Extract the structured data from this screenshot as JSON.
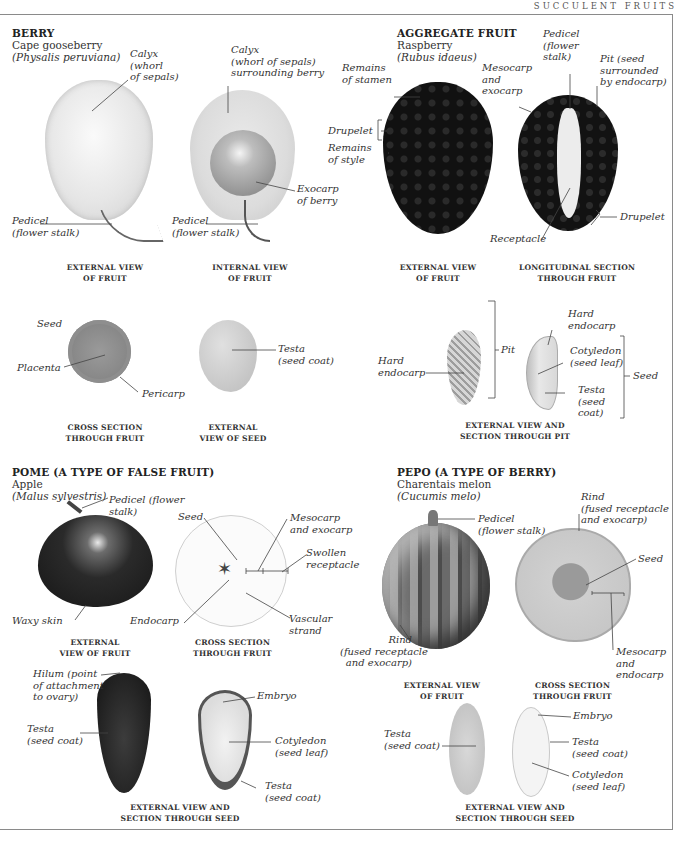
{
  "running_head": "SUCCULENT FRUITS",
  "colors": {
    "frame": "#8a8a8a",
    "text": "#2a2a2a",
    "apple": "#1e1e1e",
    "raspberry": "#141414",
    "melon_rind": "#5a5a5a",
    "melon_flesh": "#c9c9c9"
  },
  "sections": {
    "berry": {
      "title": "BERRY",
      "common_name": "Cape gooseberry",
      "scientific_name": "(Physalis peruviana)",
      "labels": {
        "calyx_ext": "Calyx\n(whorl\nof sepals)",
        "calyx_int": "Calyx\n(whorl of sepals)\nsurrounding berry",
        "pedicel_ext": "Pedicel\n(flower stalk)",
        "pedicel_int": "Pedicel\n(flower stalk)",
        "exocarp": "Exocarp\nof berry",
        "seed": "Seed",
        "placenta": "Placenta",
        "pericarp": "Pericarp",
        "testa": "Testa\n(seed coat)"
      },
      "captions": {
        "external_fruit": "EXTERNAL VIEW\nOF FRUIT",
        "internal_fruit": "INTERNAL VIEW\nOF FRUIT",
        "cross_section": "CROSS SECTION\nTHROUGH FRUIT",
        "external_seed": "EXTERNAL\nVIEW OF SEED"
      }
    },
    "aggregate": {
      "title": "AGGREGATE FRUIT",
      "common_name": "Raspberry",
      "scientific_name": "(Rubus idaeus)",
      "labels": {
        "stamen": "Remains\nof stamen",
        "drupelet_ext": "Drupelet",
        "style": "Remains\nof style",
        "mesocarp": "Mesocarp\nand\nexocarp",
        "pedicel": "Pedicel\n(flower\nstalk)",
        "pit": "Pit (seed\nsurrounded\nby endocarp)",
        "receptacle": "Receptacle",
        "drupelet_sec": "Drupelet",
        "hard_endocarp_ext": "Hard\nendocarp",
        "pit_bracket": "Pit",
        "hard_endocarp_sec": "Hard\nendocarp",
        "cotyledon": "Cotyledon\n(seed leaf)",
        "testa": "Testa\n(seed\ncoat)",
        "seed_bracket": "Seed"
      },
      "captions": {
        "external_fruit": "EXTERNAL VIEW\nOF FRUIT",
        "longitudinal": "LONGITUDINAL SECTION\nTHROUGH FRUIT",
        "pit": "EXTERNAL VIEW AND\nSECTION THROUGH PIT"
      }
    },
    "pome": {
      "title": "POME (A TYPE OF FALSE FRUIT)",
      "common_name": "Apple",
      "scientific_name": "(Malus sylvestris)",
      "labels": {
        "pedicel": "Pedicel (flower\nstalk)",
        "waxy_skin": "Waxy skin",
        "seed": "Seed",
        "mesocarp": "Mesocarp\nand exocarp",
        "receptacle": "Swollen\nreceptacle",
        "endocarp": "Endocarp",
        "vascular": "Vascular\nstrand",
        "hilum": "Hilum (point\nof attachment\nto ovary)",
        "testa_ext": "Testa\n(seed coat)",
        "embryo": "Embryo",
        "cotyledon": "Cotyledon\n(seed leaf)",
        "testa_sec": "Testa\n(seed coat)"
      },
      "captions": {
        "external_fruit": "EXTERNAL\nVIEW OF FRUIT",
        "cross_section": "CROSS SECTION\nTHROUGH FRUIT",
        "seed": "EXTERNAL VIEW AND\nSECTION THROUGH SEED"
      }
    },
    "pepo": {
      "title": "PEPO (A TYPE OF BERRY)",
      "common_name": "Charentais melon",
      "scientific_name": "(Cucumis melo)",
      "labels": {
        "pedicel": "Pedicel\n(flower stalk)",
        "rind_ext": "Rind\n(fused receptacle\nand exocarp)",
        "rind_sec": "Rind\n(fused receptacle\nand exocarp)",
        "seed": "Seed",
        "mesocarp": "Mesocarp\nand\nendocarp",
        "testa_ext": "Testa\n(seed coat)",
        "embryo": "Embryo",
        "testa_sec": "Testa\n(seed coat)",
        "cotyledon": "Cotyledon\n(seed leaf)"
      },
      "captions": {
        "external_fruit": "EXTERNAL VIEW\nOF FRUIT",
        "cross_section": "CROSS SECTION\nTHROUGH FRUIT",
        "seed": "EXTERNAL VIEW AND\nSECTION THROUGH SEED"
      }
    }
  }
}
